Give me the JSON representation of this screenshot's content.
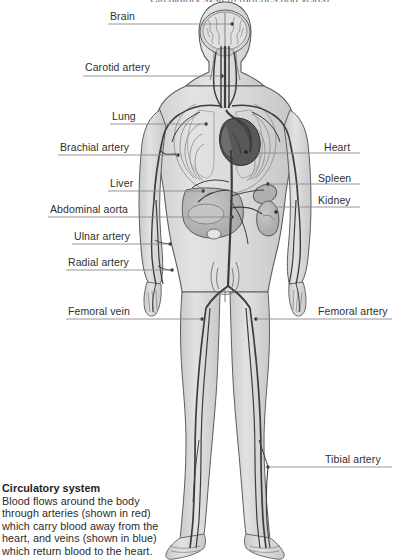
{
  "figure": {
    "title_clipped": "Circulatory system (arteries and veins)",
    "colors": {
      "body_fill": "#dcdcdc",
      "body_outline": "#5a5a5a",
      "organ_fill": "#b9b9b9",
      "heart_fill": "#555555",
      "vessel": "#3f3f3f",
      "leader_line": "#7d7d7d",
      "background": "#ffffff",
      "text": "#2f2f2f"
    }
  },
  "labels": {
    "left": [
      {
        "id": "brain",
        "text": "Brain",
        "text_x": 110,
        "text_y": 10,
        "line_y": 24,
        "line_x1": 108,
        "line_x2": 232
      },
      {
        "id": "carotid-artery",
        "text": "Carotid artery",
        "text_x": 85,
        "text_y": 61,
        "line_y": 76,
        "line_x1": 83,
        "line_x2": 222
      },
      {
        "id": "lung",
        "text": "Lung",
        "text_x": 112,
        "text_y": 110,
        "line_y": 124,
        "line_x1": 110,
        "line_x2": 206
      },
      {
        "id": "brachial-artery",
        "text": "Brachial artery",
        "text_x": 60,
        "text_y": 141,
        "line_y": 155,
        "line_x1": 58,
        "line_x2": 178
      },
      {
        "id": "liver",
        "text": "Liver",
        "text_x": 110,
        "text_y": 177,
        "line_y": 191,
        "line_x1": 108,
        "line_x2": 203
      },
      {
        "id": "abdominal-aorta",
        "text": "Abdominal aorta",
        "text_x": 50,
        "text_y": 203,
        "line_y": 217,
        "line_x1": 48,
        "line_x2": 232
      },
      {
        "id": "ulnar-artery",
        "text": "Ulnar artery",
        "text_x": 74,
        "text_y": 230,
        "line_y": 244,
        "line_x1": 72,
        "line_x2": 170
      },
      {
        "id": "radial-artery",
        "text": "Radial artery",
        "text_x": 68,
        "text_y": 256,
        "line_y": 270,
        "line_x1": 66,
        "line_x2": 172
      },
      {
        "id": "femoral-vein",
        "text": "Femoral vein",
        "text_x": 68,
        "text_y": 305,
        "line_y": 319,
        "line_x1": 66,
        "line_x2": 202
      }
    ],
    "right": [
      {
        "id": "heart",
        "text": "Heart",
        "text_x": 324,
        "text_y": 141,
        "line_y": 153,
        "line_x1": 258,
        "line_x2": 360
      },
      {
        "id": "spleen",
        "text": "Spleen",
        "text_x": 318,
        "text_y": 172,
        "line_y": 184,
        "line_x1": 268,
        "line_x2": 360
      },
      {
        "id": "kidney",
        "text": "Kidney",
        "text_x": 318,
        "text_y": 194,
        "line_y": 207,
        "line_x1": 276,
        "line_x2": 360
      },
      {
        "id": "femoral-artery",
        "text": "Femoral artery",
        "text_x": 318,
        "text_y": 305,
        "line_y": 319,
        "line_x1": 256,
        "line_x2": 392
      },
      {
        "id": "tibial-artery",
        "text": "Tibial artery",
        "text_x": 325,
        "text_y": 453,
        "line_y": 467,
        "line_x1": 268,
        "line_x2": 392
      }
    ]
  },
  "caption": {
    "title": "Circulatory system",
    "body": "Blood flows around the body through arteries (shown in red) which carry blood away from the heart, and veins (shown in blue) which return blood to the heart."
  }
}
